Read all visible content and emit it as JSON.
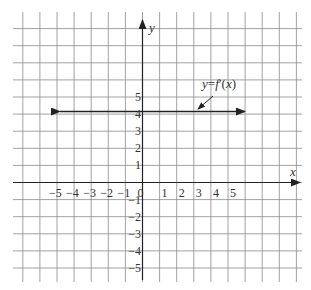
{
  "chart_data": {
    "type": "line",
    "title": "",
    "xlabel": "x",
    "ylabel": "y",
    "xlim": [
      -7,
      9.5
    ],
    "ylim": [
      -5.5,
      9.5
    ],
    "grid": true,
    "x_tick_labels": [
      "−5",
      "−4",
      "−3",
      "−2",
      "−1",
      "0",
      "1",
      "2",
      "3",
      "4",
      "5"
    ],
    "y_tick_labels": [
      "5",
      "4",
      "3",
      "2",
      "1",
      "−1",
      "−2",
      "−3",
      "−4",
      "−5"
    ],
    "series": [
      {
        "name": "y=f′(x)",
        "x": [
          -6,
          7
        ],
        "y": [
          4,
          4
        ],
        "style": "horizontal line with arrows at both ends"
      }
    ],
    "annotations": [
      {
        "text": "y=f′(x)",
        "points_to": [
          3.2,
          4
        ]
      }
    ]
  },
  "labels": {
    "x_axis": "x",
    "y_axis": "y",
    "curve": "y=f′(x)"
  }
}
